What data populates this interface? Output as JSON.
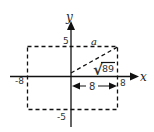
{
  "diagram": {
    "axes": {
      "x_label": "x",
      "y_label": "y"
    },
    "ticks": {
      "x_neg": "-8",
      "x_pos": "8",
      "y_pos": "5",
      "y_neg": "-5"
    },
    "rectangle": {
      "x_range": [
        -8,
        8
      ],
      "y_range": [
        -5,
        5
      ],
      "style": "dashed"
    },
    "diagonal": {
      "from": [
        0,
        0
      ],
      "to": [
        8,
        5
      ],
      "style": "dashed",
      "label_radicand": "89",
      "label_radical": "√"
    },
    "top_segment_label": "a",
    "dimension": {
      "label": "8",
      "from": 0,
      "to": 8
    },
    "colors": {
      "line": "#111111",
      "text": "#333333",
      "background": "#ffffff"
    }
  }
}
